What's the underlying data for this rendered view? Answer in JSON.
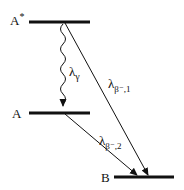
{
  "diagram": {
    "type": "energy-level decay scheme",
    "levels": [
      {
        "id": "A_star",
        "label": "A",
        "superscript": "*"
      },
      {
        "id": "A",
        "label": "A"
      },
      {
        "id": "B",
        "label": "B"
      }
    ],
    "transitions": [
      {
        "from": "A_star",
        "to": "A",
        "style": "wavy",
        "label": "λ",
        "subscript": "γ"
      },
      {
        "from": "A_star",
        "to": "B",
        "style": "straight-arrow",
        "label": "λ",
        "subscript": "β⁻,1"
      },
      {
        "from": "A",
        "to": "B",
        "style": "straight-arrow",
        "label": "λ",
        "subscript": "β⁻,2"
      }
    ]
  }
}
